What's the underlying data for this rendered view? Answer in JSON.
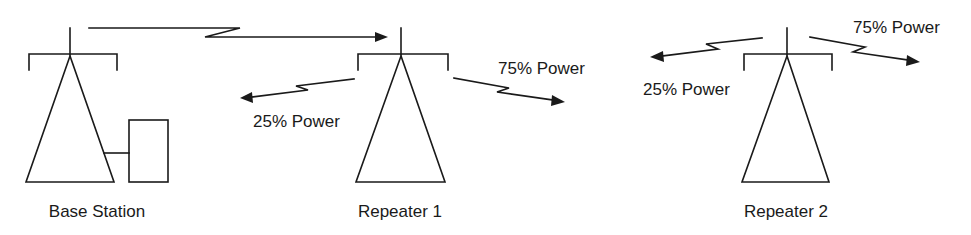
{
  "diagram": {
    "stations": [
      {
        "id": "base",
        "label": "Base Station"
      },
      {
        "id": "repeater1",
        "label": "Repeater 1"
      },
      {
        "id": "repeater2",
        "label": "Repeater 2"
      }
    ],
    "links": [
      {
        "from": "Base Station",
        "to": "Repeater 1",
        "label": ""
      },
      {
        "from": "Repeater 1",
        "direction": "left",
        "label": "25% Power"
      },
      {
        "from": "Repeater 1",
        "direction": "right",
        "label": "75% Power"
      },
      {
        "from": "Repeater 2",
        "direction": "left",
        "label": "25% Power"
      },
      {
        "from": "Repeater 2",
        "direction": "right",
        "label": "75% Power"
      }
    ],
    "colors": {
      "ink": "#1a1a1a",
      "background": "#ffffff"
    }
  }
}
